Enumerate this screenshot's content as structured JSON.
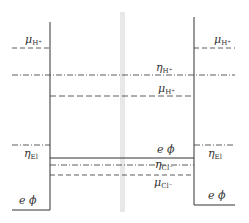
{
  "diagram": {
    "type": "energy-level diagram (electrochemical potentials across interfaces)",
    "colors": {
      "line": "#333333",
      "band": "#e6e6e6",
      "background": "#ffffff"
    },
    "regions": [
      {
        "name": "left-phase",
        "x_range": [
          12,
          50
        ]
      },
      {
        "name": "middle-phase",
        "x_range": [
          50,
          194
        ]
      },
      {
        "name": "right-phase",
        "x_range": [
          194,
          235
        ]
      }
    ],
    "labels": {
      "mu_h_left": {
        "sym": "μ",
        "sub": "H⁺"
      },
      "eta_h": {
        "sym": "η",
        "sub": "H⁺"
      },
      "mu_h_mid": {
        "sym": "μ",
        "sub": "H⁺"
      },
      "mu_h_right": {
        "sym": "μ",
        "sub": "H⁺"
      },
      "eta_el_left": {
        "sym": "η",
        "sub": "El"
      },
      "eta_el_right": {
        "sym": "η",
        "sub": "El"
      },
      "ephi_mid": {
        "sym": "e ϕ"
      },
      "eta_cl": {
        "sym": "η",
        "sub": "Cl⁻"
      },
      "mu_cl": {
        "sym": "μ",
        "sub": "Cl⁻"
      },
      "ephi_left": {
        "sym": "e ϕ"
      },
      "ephi_right": {
        "sym": "e ϕ"
      }
    },
    "levels": [
      {
        "name": "mu_h_left",
        "style": "dashed",
        "y": 48,
        "x1": 12,
        "x2": 50
      },
      {
        "name": "eta_h",
        "style": "dashdot",
        "y": 75,
        "x1": 12,
        "x2": 235
      },
      {
        "name": "mu_h_mid",
        "style": "dashed",
        "y": 96,
        "x1": 50,
        "x2": 194
      },
      {
        "name": "mu_h_right",
        "style": "dashed",
        "y": 48,
        "x1": 194,
        "x2": 235
      },
      {
        "name": "eta_el_left",
        "style": "dashdot",
        "y": 145,
        "x1": 12,
        "x2": 50
      },
      {
        "name": "eta_el_right",
        "style": "dashdot",
        "y": 145,
        "x1": 194,
        "x2": 235
      },
      {
        "name": "ephi_mid",
        "style": "solid",
        "y": 158,
        "x1": 50,
        "x2": 194
      },
      {
        "name": "eta_cl",
        "style": "dashdot",
        "y": 165,
        "x1": 50,
        "x2": 194
      },
      {
        "name": "mu_cl",
        "style": "dashed",
        "y": 175,
        "x1": 50,
        "x2": 194
      },
      {
        "name": "ephi_left",
        "style": "solid",
        "y": 210,
        "x1": 12,
        "x2": 50
      },
      {
        "name": "ephi_right",
        "style": "solid",
        "y": 205,
        "x1": 194,
        "x2": 235
      }
    ]
  }
}
